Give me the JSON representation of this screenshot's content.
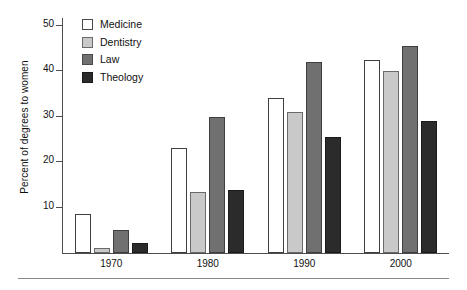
{
  "chart_data": {
    "type": "bar",
    "title": "",
    "subtitle": "",
    "xlabel": "",
    "ylabel": "Percent of degrees to women",
    "categories": [
      "1970",
      "1980",
      "1990",
      "2000"
    ],
    "series": [
      {
        "name": "Medicine",
        "color": "#ffffff",
        "values": [
          8.5,
          23.0,
          34.0,
          42.5
        ]
      },
      {
        "name": "Dentistry",
        "color": "#c9c9c9",
        "values": [
          1.0,
          13.5,
          31.0,
          40.0
        ]
      },
      {
        "name": "Law",
        "color": "#707070",
        "values": [
          5.0,
          30.0,
          42.0,
          45.5
        ]
      },
      {
        "name": "Theology",
        "color": "#2b2b2b",
        "values": [
          2.3,
          13.8,
          25.5,
          29.0
        ]
      }
    ],
    "ylim": [
      0,
      55
    ],
    "yticks": [
      10,
      20,
      30,
      40,
      50
    ],
    "ytick_labels": [
      "10",
      "20",
      "30",
      "40",
      "50"
    ],
    "grid": false,
    "legend_position": "top-left"
  },
  "legend": {
    "items": [
      {
        "label": "Medicine"
      },
      {
        "label": "Dentistry"
      },
      {
        "label": "Law"
      },
      {
        "label": "Theology"
      }
    ]
  },
  "axes": {
    "y_title": "Percent of degrees to women",
    "y_ticks": [
      "50",
      "40",
      "30",
      "20",
      "10"
    ],
    "x_ticks": [
      "1970",
      "1980",
      "1990",
      "2000"
    ]
  }
}
